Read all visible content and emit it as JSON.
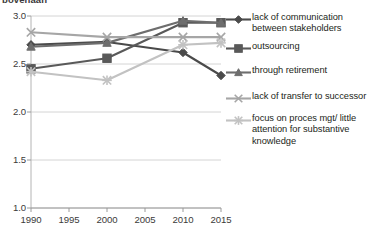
{
  "title": {
    "text": "bovenaan"
  },
  "chart_data": {
    "type": "line",
    "title": "",
    "xlabel": "",
    "ylabel": "",
    "x": [
      1990,
      2000,
      2010,
      2015
    ],
    "xlim": [
      1990,
      2015
    ],
    "ylim": [
      1.0,
      3.0
    ],
    "xticks": [
      "1990",
      "1995",
      "2000",
      "2005",
      "2010",
      "2015"
    ],
    "yticks": [
      "1.0",
      "1.5",
      "2.0",
      "2.5",
      "3.0"
    ],
    "grid": true,
    "legend_position": "right",
    "series": [
      {
        "name": "lack of communication between stakeholders",
        "marker": "diamond",
        "color": "#4a4a4a",
        "values": [
          2.7,
          2.73,
          2.62,
          2.38
        ]
      },
      {
        "name": "outsourcing",
        "marker": "square",
        "color": "#595959",
        "values": [
          2.45,
          2.56,
          2.93,
          2.93
        ]
      },
      {
        "name": "through retirement",
        "marker": "triangle",
        "color": "#6e6e6e",
        "values": [
          2.68,
          2.72,
          2.95,
          2.93
        ]
      },
      {
        "name": "lack of transfer to successor",
        "marker": "x",
        "color": "#a6a6a6",
        "values": [
          2.83,
          2.78,
          2.78,
          2.78
        ]
      },
      {
        "name": "focus on proces mgt/ little attention for substantive knowledge",
        "marker": "star",
        "color": "#c2c2c2",
        "values": [
          2.42,
          2.33,
          2.7,
          2.72
        ]
      }
    ]
  },
  "legend": {
    "items": [
      {
        "label": "lack of communication between stakeholders",
        "marker": "diamond-marker-icon",
        "color": "#4a4a4a"
      },
      {
        "label": "outsourcing",
        "marker": "square-marker-icon",
        "color": "#595959"
      },
      {
        "label": "through retirement",
        "marker": "triangle-marker-icon",
        "color": "#6e6e6e"
      },
      {
        "label": "lack of transfer to successor",
        "marker": "x-marker-icon",
        "color": "#a6a6a6"
      },
      {
        "label": "focus on proces mgt/ little attention for substantive knowledge",
        "marker": "star-marker-icon",
        "color": "#c2c2c2"
      }
    ]
  },
  "axes": {
    "y_labels": [
      "3.0",
      "2.5",
      "2.0",
      "1.5",
      "1.0"
    ],
    "x_labels": [
      "1990",
      "1995",
      "2000",
      "2005",
      "2010",
      "2015"
    ]
  }
}
